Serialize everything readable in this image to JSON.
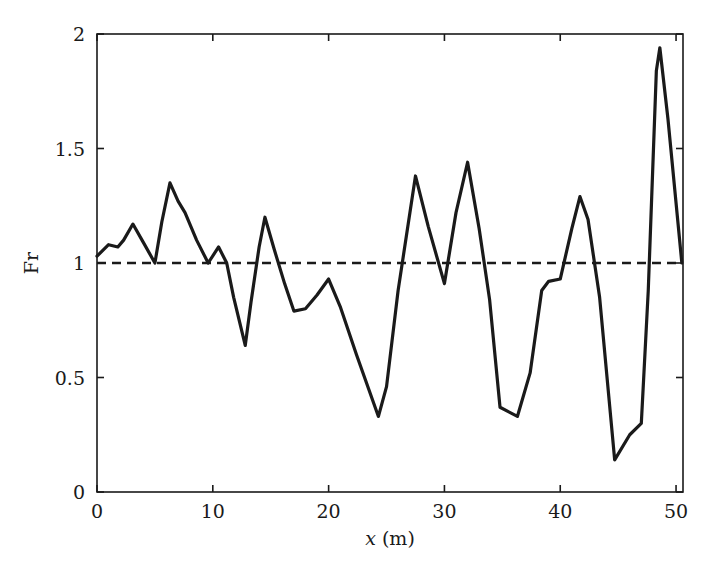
{
  "chart_data": {
    "type": "line",
    "title": "",
    "xlabel": "x (m)",
    "ylabel": "Fr",
    "xlim": [
      0,
      50.6
    ],
    "ylim": [
      0,
      2
    ],
    "grid": false,
    "legend": null,
    "xticks": [
      0,
      10,
      20,
      30,
      40,
      50
    ],
    "xticklabels": [
      "0",
      "10",
      "20",
      "30",
      "40",
      "50"
    ],
    "yticks": [
      0,
      0.5,
      1,
      1.5,
      2
    ],
    "yticklabels": [
      "0",
      "0.5",
      "1",
      "1.5",
      "2"
    ],
    "series": [
      {
        "name": "Fr",
        "style": "solid",
        "color": "#1a1a1a",
        "x": [
          0.0,
          1.0,
          1.8,
          2.3,
          3.1,
          4.0,
          5.0,
          5.6,
          6.3,
          7.0,
          7.6,
          8.6,
          9.6,
          10.5,
          11.2,
          11.8,
          12.8,
          13.3,
          14.0,
          14.5,
          15.3,
          16.2,
          17.0,
          18.0,
          19.0,
          20.0,
          21.0,
          22.4,
          24.3,
          25.0,
          26.0,
          27.5,
          28.6,
          30.0,
          31.0,
          32.0,
          33.0,
          33.9,
          34.8,
          36.3,
          37.4,
          38.4,
          39.0,
          40.0,
          41.0,
          41.7,
          42.4,
          43.4,
          44.7,
          46.0,
          47.0,
          47.6,
          48.3,
          48.6,
          49.3,
          50.5
        ],
        "y": [
          1.03,
          1.08,
          1.07,
          1.1,
          1.17,
          1.09,
          1.0,
          1.18,
          1.35,
          1.27,
          1.22,
          1.1,
          1.0,
          1.07,
          1.0,
          0.85,
          0.64,
          0.83,
          1.07,
          1.2,
          1.06,
          0.91,
          0.79,
          0.8,
          0.86,
          0.93,
          0.81,
          0.6,
          0.33,
          0.46,
          0.88,
          1.38,
          1.16,
          0.91,
          1.22,
          1.44,
          1.15,
          0.84,
          0.37,
          0.33,
          0.52,
          0.88,
          0.92,
          0.93,
          1.15,
          1.29,
          1.19,
          0.85,
          0.14,
          0.25,
          0.3,
          0.88,
          1.84,
          1.94,
          1.63,
          1.0
        ]
      }
    ],
    "reference_lines": [
      {
        "name": "critical-froude",
        "orientation": "horizontal",
        "value": 1,
        "style": "dashed",
        "color": "#1a1a1a"
      }
    ]
  },
  "axes": {
    "frame": "full-box",
    "tick_direction": "inward"
  }
}
